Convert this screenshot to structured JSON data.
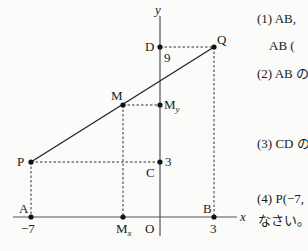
{
  "diagram": {
    "axes": {
      "x_label": "x",
      "y_label": "y",
      "origin_label": "O"
    },
    "points": {
      "A": {
        "label": "A",
        "coord": [
          -7,
          0
        ],
        "tick": "−7"
      },
      "B": {
        "label": "B",
        "coord": [
          3,
          0
        ],
        "tick": "3"
      },
      "P": {
        "label": "P",
        "coord": [
          -7,
          3
        ]
      },
      "Q": {
        "label": "Q",
        "coord": [
          3,
          9
        ]
      },
      "C": {
        "label": "C",
        "coord": [
          0,
          3
        ],
        "tick": "3"
      },
      "D": {
        "label": "D",
        "coord": [
          0,
          9
        ],
        "tick": "9"
      },
      "M": {
        "label": "M"
      },
      "Mx": {
        "label": "M",
        "sub": "x"
      },
      "My": {
        "label": "M",
        "sub": "y"
      }
    }
  },
  "questions": [
    {
      "id": "q1",
      "text": "(1) AB, "
    },
    {
      "id": "q1b",
      "text": "AB ("
    },
    {
      "id": "q2",
      "text": "(2) AB の"
    },
    {
      "id": "q3",
      "text": "(3) CD の"
    },
    {
      "id": "q4",
      "text": "(4) P(−7,"
    },
    {
      "id": "q4b",
      "text": "なさい。"
    }
  ]
}
